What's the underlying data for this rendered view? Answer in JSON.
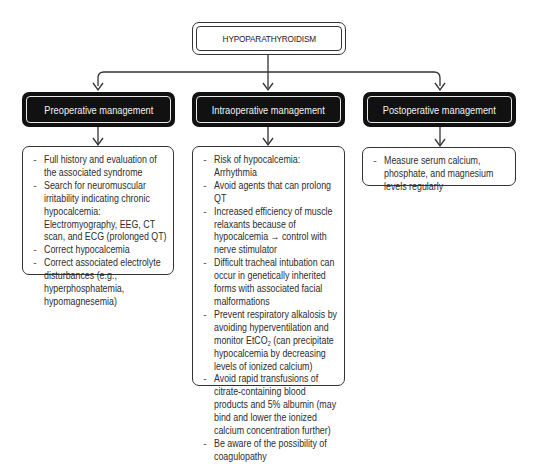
{
  "root": {
    "title": "HYPOPARATHYROIDISM"
  },
  "columns": [
    {
      "header": "Preoperative management",
      "items": [
        "Full history and evaluation of the associated syndrome",
        "Search for neuromuscular irritability indicating chronic hypocalcemia: Electromyography, EEG, CT scan, and ECG (prolonged QT)",
        "Correct hypocalcemia",
        "Correct associated electrolyte disturbances (e.g., hyperphosphatemia, hypomagnesemia)"
      ]
    },
    {
      "header": "Intraoperative management",
      "items": [
        "Risk of hypocalcemia: Arrhythmia",
        "Avoid agents that can prolong QT",
        "Increased efficiency of muscle relaxants because of hypocalcemia → control with nerve stimulator",
        "Difficult tracheal intubation can occur in genetically inherited forms with associated facial malformations",
        "Prevent respiratory alkalosis by avoiding hyperventilation and monitor EtCO",
        "Avoid rapid transfusions of citrate-containing blood products and 5% albumin (may bind and lower the ionized calcium concentration further)",
        "Be aware of the possibility of coagulopathy"
      ],
      "item5_subscript": "2",
      "item5_suffix": " (can precipitate hypocalcemia by decreasing levels of ionized calcium)"
    },
    {
      "header": "Postoperative management",
      "items": [
        "Measure serum calcium, phosphate, and magnesium levels regularly"
      ]
    }
  ],
  "bullet_glyph": "-",
  "colors": {
    "header_fill": "#111111",
    "header_text": "#f2f2f2",
    "line": "#333333",
    "background": "#ffffff"
  }
}
